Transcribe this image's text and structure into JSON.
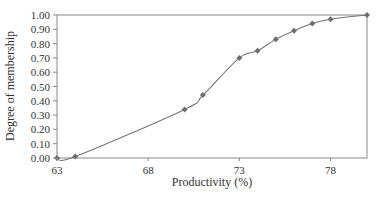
{
  "chart_data": {
    "type": "line",
    "title": "",
    "xlabel": "Productivity (%)",
    "ylabel": "Degree of membership",
    "xlim": [
      63,
      80
    ],
    "ylim": [
      0,
      1
    ],
    "x_ticks": [
      63,
      68,
      73,
      78
    ],
    "y_ticks": [
      "0.00",
      "0.10",
      "0.20",
      "0.30",
      "0.40",
      "0.50",
      "0.60",
      "0.70",
      "0.80",
      "0.90",
      "1.00"
    ],
    "grid": false,
    "legend": null,
    "series": [
      {
        "name": "Degree of membership",
        "color": "#777777",
        "marker": "diamond",
        "x": [
          63,
          64,
          70,
          71,
          73,
          74,
          75,
          76,
          77,
          78,
          80
        ],
        "y": [
          0.0,
          0.01,
          0.34,
          0.44,
          0.7,
          0.75,
          0.83,
          0.89,
          0.94,
          0.97,
          1.0
        ]
      }
    ]
  }
}
